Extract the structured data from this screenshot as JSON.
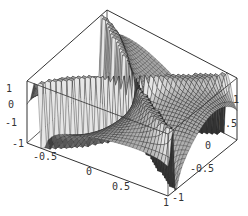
{
  "chart_data": {
    "type": "surface3d",
    "title": "",
    "xlabel": "",
    "ylabel": "",
    "zlabel": "",
    "x_range": [
      -1,
      1
    ],
    "y_range": [
      -1,
      1
    ],
    "z_range": [
      -1,
      1
    ],
    "x_ticks": [
      "-1",
      "-0.5",
      "0",
      "0.5",
      "1"
    ],
    "y_ticks": [
      "-1",
      "-0.5",
      "0",
      "0.5",
      "1"
    ],
    "z_ticks": [
      "-1",
      "0",
      "1"
    ],
    "grid_resolution": 40,
    "colormap": "grayscale-shaded",
    "box": true
  },
  "colors": {
    "background": "#ffffff",
    "box_line": "#333333",
    "mesh_line": "#222222",
    "surface_light": "#c8c8c8",
    "surface_dark": "#555555"
  },
  "labels": {
    "z_axis": [
      {
        "text": "1",
        "x": 6,
        "y": 92
      },
      {
        "text": "0",
        "x": 8,
        "y": 108
      },
      {
        "text": "-1",
        "x": 5,
        "y": 126
      }
    ],
    "x_axis": [
      {
        "text": "-1",
        "x": 12,
        "y": 147
      },
      {
        "text": "-0.5",
        "x": 33,
        "y": 160
      },
      {
        "text": "0",
        "x": 86,
        "y": 175
      },
      {
        "text": "0.5",
        "x": 112,
        "y": 190
      },
      {
        "text": "1",
        "x": 163,
        "y": 206
      }
    ],
    "y_axis": [
      {
        "text": "-1",
        "x": 172,
        "y": 201
      },
      {
        "text": "-0.5",
        "x": 190,
        "y": 172
      },
      {
        "text": "0",
        "x": 205,
        "y": 149
      },
      {
        "text": "0.5",
        "x": 219,
        "y": 127
      },
      {
        "text": "1",
        "x": 233,
        "y": 103
      }
    ]
  }
}
